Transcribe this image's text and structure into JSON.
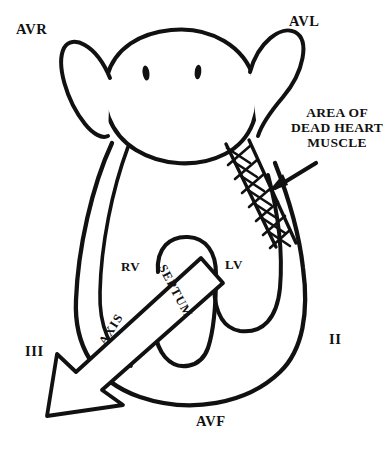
{
  "figure": {
    "background_color": "#ffffff",
    "ink_color": "#111111"
  },
  "lead_labels": {
    "avr": "AVR",
    "avl": "AVL",
    "lead_two": "II",
    "lead_three": "III",
    "avf": "AVF"
  },
  "chamber_labels": {
    "rv": "RV",
    "lv": "LV",
    "septum": "SEPTUM"
  },
  "axis_arrow": {
    "label": "AXIS"
  },
  "callout": {
    "line1": "AREA OF",
    "line2": "DEAD HEART",
    "line3": "MUSCLE"
  },
  "icons": {
    "callout_arrow": "arrow-pointing-down-left-icon",
    "axis_arrow": "hollow-axis-arrow-icon",
    "hatch_region": "cross-hatched-infarct-icon",
    "valve_marks": "valve-oval-icon"
  }
}
